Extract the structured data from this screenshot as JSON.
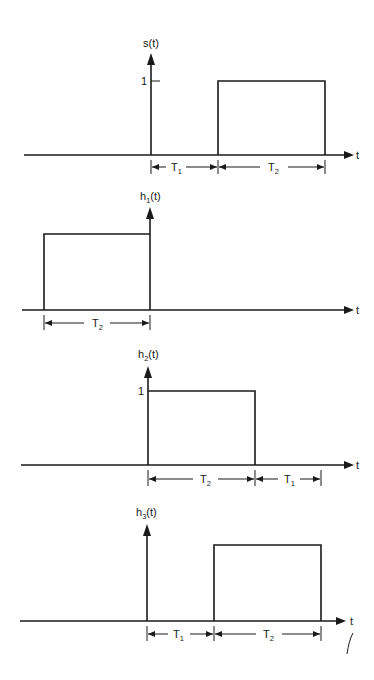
{
  "figure": {
    "time_axis_label": "t",
    "panels": [
      {
        "id": "s",
        "label_main": "s",
        "label_sub": "",
        "label_suffix": "(t)",
        "amplitude_label": "1",
        "pulse": "starts at T1, duration T2",
        "dimensions": [
          {
            "main": "T",
            "sub": "1"
          },
          {
            "main": "T",
            "sub": "2"
          }
        ]
      },
      {
        "id": "h1",
        "label_main": "h",
        "label_sub": "1",
        "label_suffix": "(t)",
        "amplitude_label": "",
        "pulse": "from -T2 to 0",
        "dimensions": [
          {
            "main": "T",
            "sub": "2"
          }
        ]
      },
      {
        "id": "h2",
        "label_main": "h",
        "label_sub": "2",
        "label_suffix": "(t)",
        "amplitude_label": "1",
        "pulse": "from 0 to T2",
        "dimensions": [
          {
            "main": "T",
            "sub": "2"
          },
          {
            "main": "T",
            "sub": "1"
          }
        ]
      },
      {
        "id": "h3",
        "label_main": "h",
        "label_sub": "3",
        "label_suffix": "(t)",
        "amplitude_label": "",
        "pulse": "from T1 to T1+T2",
        "dimensions": [
          {
            "main": "T",
            "sub": "1"
          },
          {
            "main": "T",
            "sub": "2"
          }
        ]
      }
    ]
  }
}
